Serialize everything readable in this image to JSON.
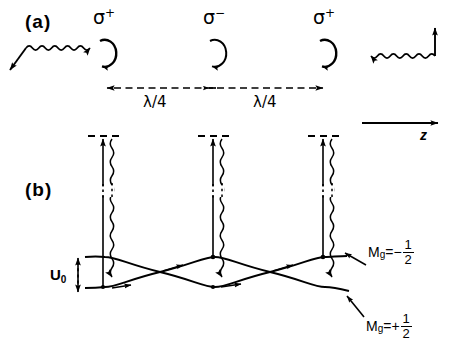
{
  "figure": {
    "kind": "sisyphus-cooling-diagram",
    "width": 453,
    "height": 353,
    "background": "#ffffff",
    "ink": "#000000"
  },
  "panels": {
    "a": {
      "tag": "(a)",
      "description": "Polarization gradient of two counter-propagating linearly cross-polarized beams"
    },
    "b": {
      "tag": "(b)",
      "description": "Light shifted ground state sublevels forming periodic potentials with optical pumping"
    }
  },
  "polarization_sites": [
    {
      "label": "σ",
      "charge": "+",
      "x": 105,
      "handedness": "counterclockwise"
    },
    {
      "label": "σ",
      "charge": "−",
      "x": 215,
      "handedness": "clockwise"
    },
    {
      "label": "σ",
      "charge": "+",
      "x": 325,
      "handedness": "counterclockwise"
    }
  ],
  "spacings": [
    {
      "label": "λ/4",
      "from_x": 105,
      "to_x": 215
    },
    {
      "label": "λ/4",
      "from_x": 215,
      "to_x": 325
    }
  ],
  "beams": {
    "left": {
      "direction": "rightward",
      "polarization_label": "",
      "wavy": true
    },
    "right": {
      "direction": "leftward",
      "polarization_label": "",
      "wavy": true
    }
  },
  "axis": {
    "label": "z",
    "direction": "rightward"
  },
  "energy": {
    "depth_label": "U",
    "depth_sub": "0"
  },
  "sublevels": [
    {
      "name": "upper-curve",
      "label_base": "M",
      "label_sub": "g",
      "label_eq": "=−",
      "numerator": "1",
      "denominator": "2",
      "phase": "crest-at-sigma-minus"
    },
    {
      "name": "lower-curve",
      "label_base": "M",
      "label_sub": "g",
      "label_eq": "=+",
      "numerator": "1",
      "denominator": "2",
      "phase": "crest-at-sigma-plus"
    }
  ],
  "transitions": [
    {
      "site_x": 105,
      "absorption": "straight-up-arrow",
      "emission": "wavy-down-arrow"
    },
    {
      "site_x": 215,
      "absorption": "straight-up-arrow",
      "emission": "wavy-down-arrow"
    },
    {
      "site_x": 325,
      "absorption": "straight-up-arrow",
      "emission": "wavy-down-arrow"
    }
  ]
}
